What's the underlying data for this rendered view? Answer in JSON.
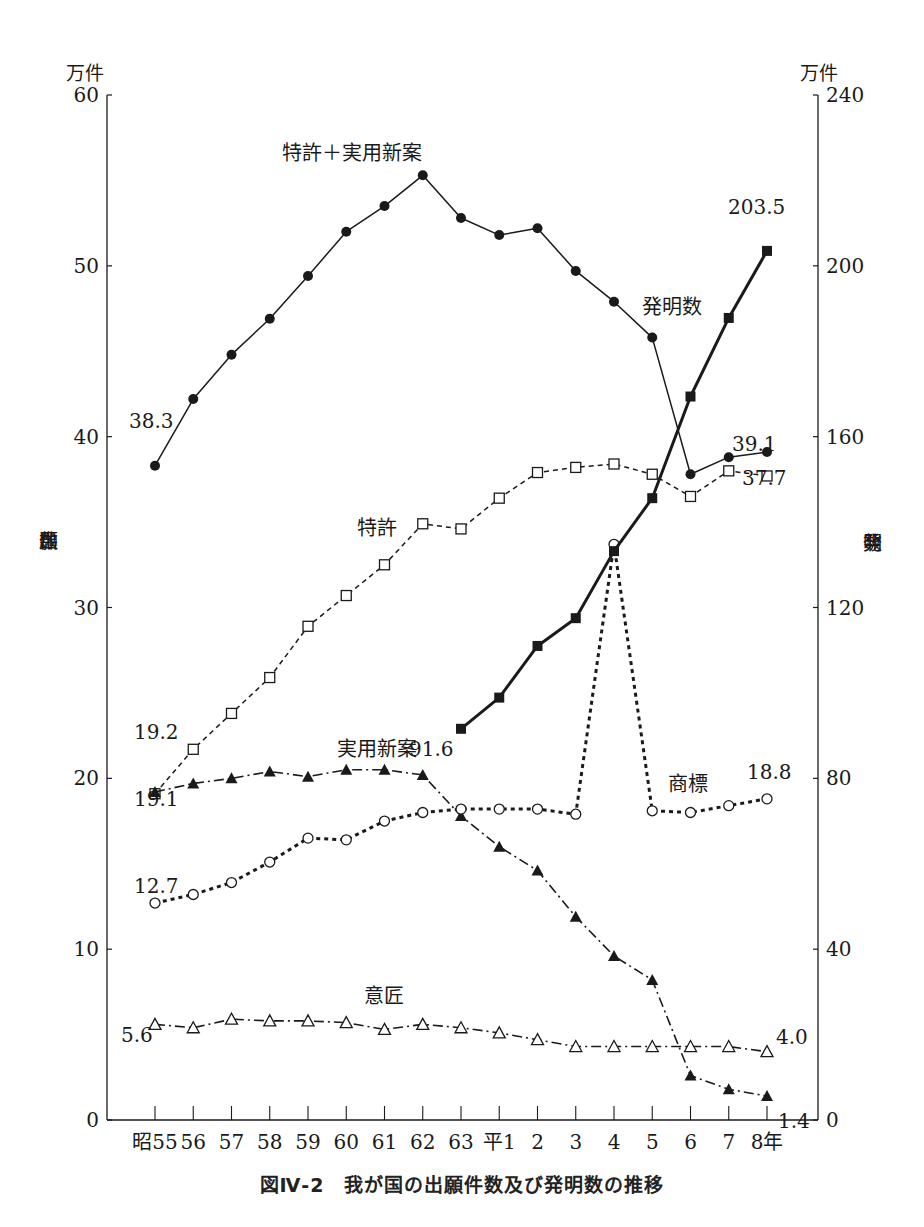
{
  "caption": "図Ⅳ-2　我が国の出願件数及び発明数の推移",
  "left_axis": {
    "unit": "万件",
    "label_chars": [
      "出",
      "願",
      "件",
      "数"
    ],
    "ticks": [
      0,
      10,
      20,
      30,
      40,
      50,
      60
    ]
  },
  "right_axis": {
    "unit": "万件",
    "label_chars": [
      "発",
      "明",
      "数"
    ],
    "ticks": [
      0,
      40,
      80,
      120,
      160,
      200,
      240
    ]
  },
  "chart_data": {
    "type": "line",
    "xlabel": "",
    "ylabel": "出願件数 (万件)",
    "y2label": "発明数 (万件)",
    "ylim": [
      0,
      60
    ],
    "y2lim": [
      0,
      240
    ],
    "grid": false,
    "legend_position": "inline labels",
    "categories": [
      "昭55",
      "56",
      "57",
      "58",
      "59",
      "60",
      "61",
      "62",
      "63",
      "平1",
      "2",
      "3",
      "4",
      "5",
      "6",
      "7",
      "8年"
    ],
    "series": [
      {
        "name": "特許+実用新案",
        "axis": "left",
        "marker": "filled-circle",
        "line": "solid",
        "values": [
          38.3,
          42.2,
          44.8,
          46.9,
          49.4,
          52.0,
          53.5,
          55.3,
          52.8,
          51.8,
          52.2,
          49.7,
          47.9,
          45.8,
          37.8,
          38.8,
          39.1
        ],
        "labels": {
          "start": "38.3",
          "end": "39.1"
        }
      },
      {
        "name": "特許",
        "axis": "left",
        "marker": "open-square",
        "line": "dashed",
        "values": [
          19.1,
          21.7,
          23.8,
          25.9,
          28.9,
          30.7,
          32.5,
          34.9,
          34.6,
          36.4,
          37.9,
          38.2,
          38.4,
          37.8,
          36.5,
          38.0,
          37.7
        ],
        "labels": {
          "start": "19.1",
          "end": "37.7"
        }
      },
      {
        "name": "実用新案",
        "axis": "left",
        "marker": "filled-triangle",
        "line": "dash-dot",
        "values": [
          19.2,
          19.7,
          20.0,
          20.4,
          20.1,
          20.5,
          20.5,
          20.2,
          17.8,
          16.0,
          14.6,
          11.9,
          9.6,
          8.2,
          2.6,
          1.8,
          1.4
        ],
        "labels": {
          "start": "19.2",
          "end": "1.4"
        }
      },
      {
        "name": "商標",
        "axis": "left",
        "marker": "open-circle",
        "line": "heavy-dotted",
        "values": [
          12.7,
          13.2,
          13.9,
          15.1,
          16.5,
          16.4,
          17.5,
          18.0,
          18.2,
          18.2,
          18.2,
          17.9,
          33.7,
          18.1,
          18.0,
          18.4,
          18.8
        ],
        "labels": {
          "start": "12.7",
          "end": "18.8"
        }
      },
      {
        "name": "意匠",
        "axis": "left",
        "marker": "open-triangle",
        "line": "dash-dot",
        "values": [
          5.6,
          5.4,
          5.9,
          5.8,
          5.8,
          5.7,
          5.3,
          5.6,
          5.4,
          5.1,
          4.7,
          4.3,
          4.3,
          4.3,
          4.3,
          4.3,
          4.0
        ],
        "labels": {
          "start": "5.6",
          "end": "4.0"
        }
      },
      {
        "name": "発明数",
        "axis": "right",
        "marker": "filled-square",
        "line": "heavy-solid",
        "values": [
          null,
          null,
          null,
          null,
          null,
          null,
          null,
          null,
          91.6,
          98.9,
          111.0,
          117.5,
          133.2,
          145.6,
          169.4,
          187.8,
          203.5
        ],
        "labels": {
          "start": "91.6",
          "end": "203.5"
        }
      }
    ],
    "annotations": [
      {
        "text": "特許＋実用新案",
        "near": "peak 62"
      },
      {
        "text": "発明数",
        "near": "平4"
      },
      {
        "text": "特許",
        "near": "61"
      },
      {
        "text": "実用新案",
        "near": "61-63"
      },
      {
        "text": "商標",
        "near": "平5-6"
      },
      {
        "text": "意匠",
        "near": "61"
      }
    ]
  }
}
